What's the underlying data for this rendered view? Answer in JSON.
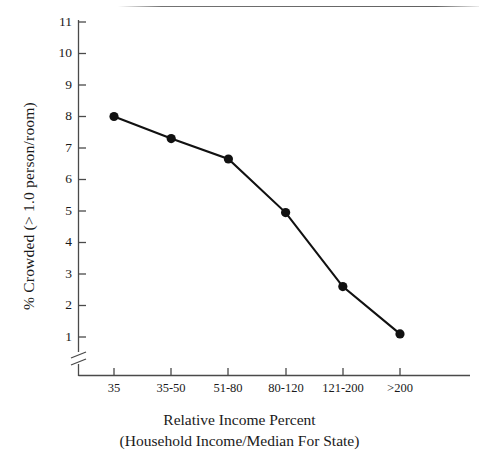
{
  "chart_data": {
    "type": "line",
    "title": "",
    "xlabel": "Relative Income Percent",
    "xlabel_sub": "(Household Income/Median For State)",
    "ylabel": "% Crowded (> 1.0  person/room)",
    "categories": [
      "35",
      "35-50",
      "51-80",
      "80-120",
      "121-200",
      ">200"
    ],
    "values": [
      8.0,
      7.3,
      6.65,
      4.95,
      2.6,
      1.1
    ],
    "ytick_labels": [
      "1",
      "2",
      "3",
      "4",
      "5",
      "6",
      "7",
      "8",
      "9",
      "10",
      "11"
    ],
    "yticks": [
      1,
      2,
      3,
      4,
      5,
      6,
      7,
      8,
      9,
      10,
      11
    ],
    "ylim": [
      1,
      11
    ],
    "axis_break": true,
    "axis_break_note": "//",
    "grid": false,
    "legend": "none",
    "marker": "filled-circle",
    "line_color": "#111111",
    "marker_color": "#111111",
    "axis_color": "#4a4a4a",
    "background_color": "#ffffff"
  }
}
